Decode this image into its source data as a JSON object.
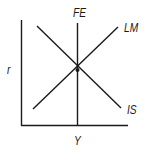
{
  "diagram": {
    "axes": {
      "y_label": "r",
      "x_label": "Y"
    },
    "curves": [
      {
        "name": "FE",
        "label": "FE",
        "type": "vertical"
      },
      {
        "name": "LM",
        "label": "LM",
        "type": "upward-sloping"
      },
      {
        "name": "IS",
        "label": "IS",
        "type": "downward-sloping"
      }
    ],
    "equilibrium_point": {
      "marker": "dot"
    },
    "colors": {
      "line": "#1a1a1a",
      "background": "#ffffff"
    }
  }
}
